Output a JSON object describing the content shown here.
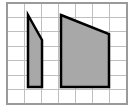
{
  "figure": {
    "type": "geometry-diagram",
    "canvas": {
      "width": 137,
      "height": 112,
      "background": "#ffffff"
    },
    "grid": {
      "name": "square-grid",
      "x": 7,
      "y": 3,
      "width": 120,
      "height": 101,
      "columns": 7,
      "rows": 7,
      "cell_width": 17.14,
      "cell_height": 14.43,
      "line_color": "#bfbfbf",
      "line_width": 1,
      "border_color": "#9a9a9a",
      "border_width": 1.5,
      "background": "#ffffff"
    },
    "shapes": [
      {
        "name": "small-quadrilateral",
        "label": "left shape",
        "kind": "quadrilateral",
        "fill": "#a8a8a8",
        "stroke": "#000000",
        "stroke_width": 2.5,
        "points": "28,15 42,40 42,87 28,87",
        "vertices": [
          {
            "x": 28,
            "y": 15
          },
          {
            "x": 42,
            "y": 40
          },
          {
            "x": 42,
            "y": 87
          },
          {
            "x": 28,
            "y": 87
          }
        ]
      },
      {
        "name": "large-quadrilateral",
        "label": "right shape",
        "kind": "quadrilateral",
        "fill": "#a8a8a8",
        "stroke": "#000000",
        "stroke_width": 2.5,
        "points": "61,15 109,34 109,87 61,87",
        "vertices": [
          {
            "x": 61,
            "y": 15
          },
          {
            "x": 109,
            "y": 34
          },
          {
            "x": 109,
            "y": 87
          },
          {
            "x": 61,
            "y": 87
          }
        ]
      }
    ]
  }
}
